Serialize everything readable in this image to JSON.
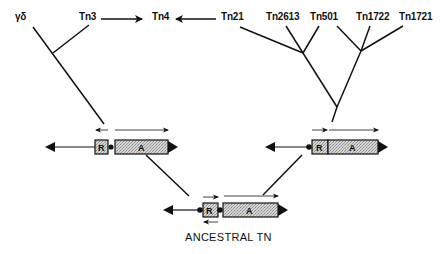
{
  "diagram": {
    "colors": {
      "line": "#111111",
      "box_fill": "#c8c8c8",
      "background": "#ffffff"
    },
    "taxa": [
      {
        "id": "gd",
        "label": "γδ"
      },
      {
        "id": "tn3",
        "label": "Tn3"
      },
      {
        "id": "tn4",
        "label": "Tn4"
      },
      {
        "id": "tn21",
        "label": "Tn21"
      },
      {
        "id": "tn2613",
        "label": "Tn2613"
      },
      {
        "id": "tn501",
        "label": "Tn501"
      },
      {
        "id": "tn1722",
        "label": "Tn1722"
      },
      {
        "id": "tn1721",
        "label": "Tn1721"
      }
    ],
    "relations": [
      {
        "from": "Tn3",
        "to": "Tn4",
        "type": "arrow"
      },
      {
        "from": "Tn21",
        "to": "Tn4",
        "type": "arrow"
      }
    ],
    "structures": {
      "left": {
        "r_label": "R",
        "a_label": "A",
        "r_direction": "left",
        "a_direction": "right"
      },
      "right": {
        "r_label": "R",
        "a_label": "A",
        "r_direction": "right",
        "a_direction": "right"
      },
      "ancestral": {
        "r_label": "R",
        "a_label": "A",
        "r_direction": "both",
        "a_direction": "right",
        "caption": "ANCESTRAL TN"
      }
    }
  }
}
